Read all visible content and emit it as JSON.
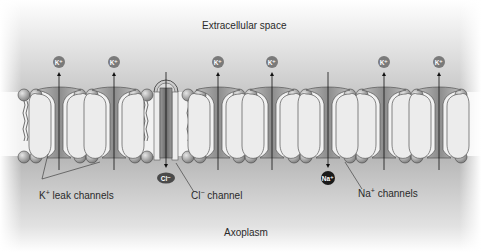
{
  "diagram": {
    "regions": {
      "top_label": "Extracellular space",
      "bottom_label": "Axoplasm"
    },
    "labels": {
      "k_leak": {
        "main": "K",
        "sup": "+",
        "rest": " leak channels"
      },
      "cl_channel": {
        "main": "Cl",
        "sup": "−",
        "rest": " channel"
      },
      "na_channels": {
        "main": "Na",
        "sup": "+",
        "rest": " channels"
      }
    },
    "ions": {
      "k": "K⁺",
      "cl": "Cl⁻",
      "na": "Na⁺"
    },
    "k_leak_channel_positions_x": [
      59,
      114,
      218,
      272,
      384,
      439
    ],
    "cl_channel_position_x": 166,
    "na_channel_position_x": 328,
    "ion_flow": {
      "k": "outward (to extracellular space)",
      "cl": "inward (to axoplasm)",
      "na": "inward (to axoplasm)"
    },
    "colors": {
      "extracellular_top": "#ffffff",
      "extracellular_bottom": "#c8c8c8",
      "axoplasm_top": "#b4b4b4",
      "axoplasm_bottom": "#ffffff",
      "protein": "#e8e8e8",
      "channel_core": "#8a8a8a",
      "ion_k": "#7a7a7a",
      "ion_cl": "#4a4a4a",
      "ion_na": "#1a1a1a"
    }
  }
}
